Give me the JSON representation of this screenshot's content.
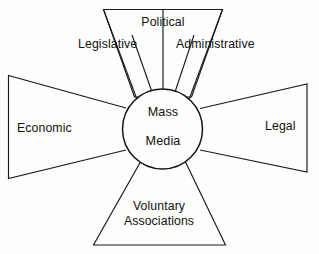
{
  "diagram": {
    "title": "Mass Media",
    "type": "hub-and-spoke radial sector diagram",
    "hub": {
      "line1": "Mass",
      "line2": "Media"
    },
    "sectors": {
      "top": {
        "position": "top",
        "subdivisions": [
          {
            "label": "Legislative"
          },
          {
            "label": "Political"
          },
          {
            "label": "Administrative"
          }
        ]
      },
      "left": {
        "position": "left",
        "label": "Economic"
      },
      "right": {
        "position": "right",
        "label": "Legal"
      },
      "bottom": {
        "position": "bottom",
        "label_line1": "Voluntary",
        "label_line2": "Associations"
      }
    },
    "colors": {
      "stroke": "#1b1b1b",
      "background": "#fdfdfc",
      "text": "#121212"
    }
  }
}
